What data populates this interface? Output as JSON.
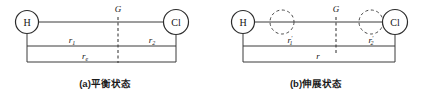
{
  "figure": {
    "title_implicit": "",
    "panels": [
      {
        "id": "a",
        "caption": "(a)平衡状态",
        "atoms": [
          {
            "label": "H",
            "cx": 27,
            "cy": 22,
            "r": 11.5,
            "style": "solid"
          },
          {
            "label": "Cl",
            "cx": 176,
            "cy": 22,
            "r": 12.5,
            "style": "solid"
          }
        ],
        "center_of_mass": {
          "label": "G",
          "x": 118,
          "label_x": 118,
          "label_y": 13
        },
        "measures": [
          {
            "name": "r1",
            "base": "r",
            "sub": "1",
            "prime": false,
            "x1": 27,
            "x2": 118,
            "y": 46,
            "label_x": 72,
            "label_y": 42
          },
          {
            "name": "r2",
            "base": "r",
            "sub": "2",
            "prime": false,
            "x1": 118,
            "x2": 176,
            "y": 46,
            "label_x": 152,
            "label_y": 42
          },
          {
            "name": "r0",
            "base": "r",
            "sub": "e",
            "prime": false,
            "x1": 27,
            "x2": 176,
            "y": 62,
            "label_x": 85,
            "label_y": 58
          }
        ]
      },
      {
        "id": "b",
        "caption": "(b)伸展状态",
        "atoms": [
          {
            "label": "H",
            "cx": 243,
            "cy": 22,
            "r": 11.5,
            "style": "solid"
          },
          {
            "label": "",
            "cx": 282,
            "cy": 22,
            "r": 12.0,
            "style": "dashed"
          },
          {
            "label": "",
            "cx": 371,
            "cy": 22,
            "r": 12.0,
            "style": "dashed"
          },
          {
            "label": "Cl",
            "cx": 395,
            "cy": 22,
            "r": 12.5,
            "style": "solid"
          }
        ],
        "center_of_mass": {
          "label": "G",
          "x": 336,
          "label_x": 336,
          "label_y": 13
        },
        "measures": [
          {
            "name": "r1p",
            "base": "r",
            "sub": "1",
            "prime": true,
            "x1": 243,
            "x2": 336,
            "y": 46,
            "label_x": 290,
            "label_y": 42
          },
          {
            "name": "r2p",
            "base": "r",
            "sub": "2",
            "prime": true,
            "x1": 336,
            "x2": 395,
            "y": 46,
            "label_x": 371,
            "label_y": 42
          },
          {
            "name": "r",
            "base": "r",
            "sub": "",
            "prime": false,
            "x1": 243,
            "x2": 395,
            "y": 62,
            "label_x": 318,
            "label_y": 58
          }
        ]
      }
    ],
    "colors": {
      "stroke": "#3a3a3a",
      "text": "#141414",
      "background": "#ffffff"
    }
  }
}
